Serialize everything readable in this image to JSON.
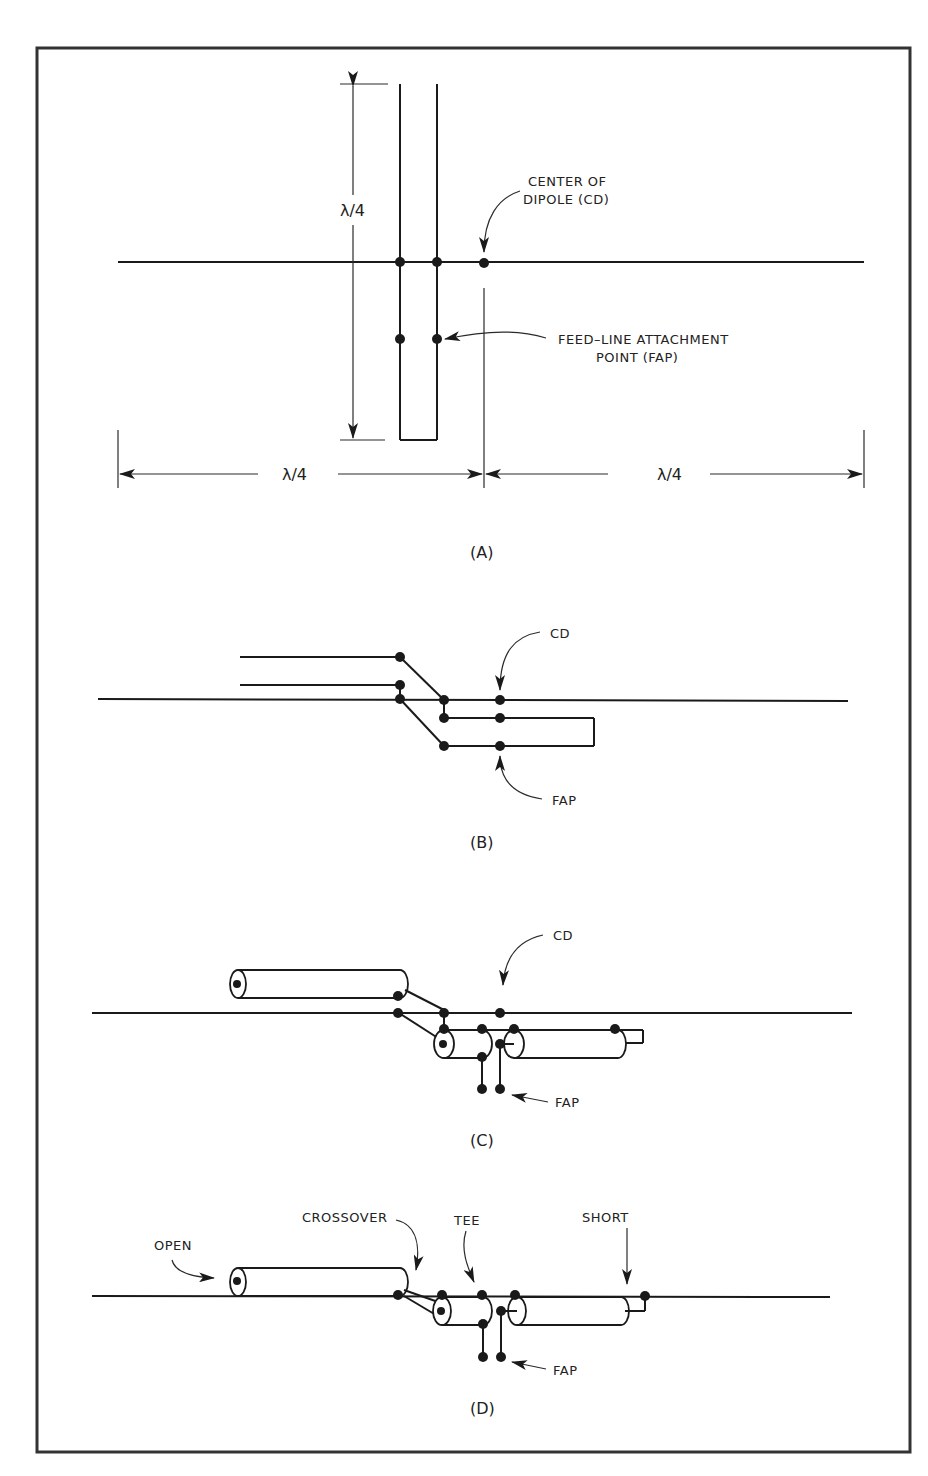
{
  "figure": {
    "panels": [
      {
        "id": "A",
        "label": "(A)",
        "annotations": {
          "vertical_dimension": "λ/4",
          "left_dimension": "λ/4",
          "right_dimension": "λ/4",
          "center_label_line1": "CENTER OF",
          "center_label_line2": "DIPOLE (CD)",
          "fap_label_line1": "FEED–LINE ATTACHMENT",
          "fap_label_line2": "POINT (FAP)"
        }
      },
      {
        "id": "B",
        "label": "(B)",
        "annotations": {
          "cd": "CD",
          "fap": "FAP"
        }
      },
      {
        "id": "C",
        "label": "(C)",
        "annotations": {
          "cd": "CD",
          "fap": "FAP"
        }
      },
      {
        "id": "D",
        "label": "(D)",
        "annotations": {
          "open": "OPEN",
          "crossover": "CROSSOVER",
          "tee": "TEE",
          "short": "SHORT",
          "fap": "FAP"
        }
      }
    ]
  }
}
